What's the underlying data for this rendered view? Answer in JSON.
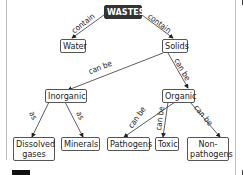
{
  "diagram": {
    "type": "concept-map",
    "nodes": {
      "wastes": "WASTES",
      "water": "Water",
      "solids": "Solids",
      "inorganic": "Inorganic",
      "organic": "Organic",
      "dissolved_gases_1": "Dissolved",
      "dissolved_gases_2": "gases",
      "minerals": "Minerals",
      "pathogens": "Pathogens",
      "toxic": "Toxic",
      "non_pathogens_1": "Non-",
      "non_pathogens_2": "pathogens"
    },
    "edges": {
      "wastes_water": "contain",
      "wastes_solids": "contain",
      "solids_inorganic": "can be",
      "solids_organic": "can be",
      "inorganic_dissolved": "as",
      "inorganic_minerals": "as",
      "organic_pathogens": "can be",
      "organic_toxic": "can be",
      "organic_nonpathogens": "can be"
    }
  }
}
